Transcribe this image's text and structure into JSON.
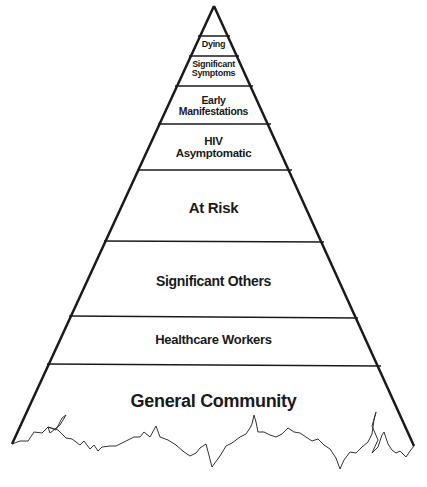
{
  "diagram": {
    "type": "pyramid",
    "levels": [
      {
        "label": "Dying"
      },
      {
        "label": "Significant Symptoms",
        "line1": "Significant",
        "line2": "Symptoms"
      },
      {
        "label": "Early Manifestations",
        "line1": "Early",
        "line2": "Manifestations"
      },
      {
        "label": "HIV Asymptomatic",
        "line1": "HIV",
        "line2": "Asymptomatic"
      },
      {
        "label": "At Risk"
      },
      {
        "label": "Significant Others"
      },
      {
        "label": "Healthcare Workers"
      },
      {
        "label": "General Community"
      }
    ],
    "colors": {
      "line": "#1a1a1a",
      "background": "#ffffff"
    }
  }
}
